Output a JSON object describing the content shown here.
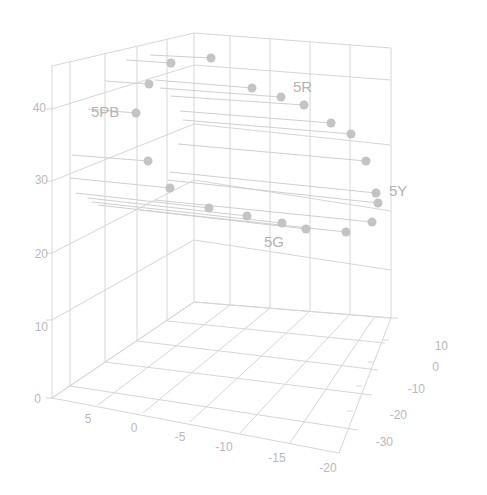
{
  "chart_data": {
    "type": "scatter3d",
    "title": "",
    "xlabel": "",
    "ylabel": "",
    "zlabel": "",
    "grid": true,
    "axes": {
      "z": {
        "ticks": [
          0,
          10,
          20,
          30,
          40
        ],
        "tick_labels": [
          "0",
          "10",
          "20",
          "30",
          "40"
        ]
      },
      "x": {
        "ticks": [
          5,
          0,
          -5,
          -10,
          -15,
          -20
        ],
        "tick_labels": [
          "5",
          "0",
          "-5",
          "-10",
          "-15",
          "-20"
        ]
      },
      "y": {
        "ticks": [
          10,
          0,
          -10,
          -20,
          -30
        ],
        "tick_labels": [
          "10",
          "0",
          "-10",
          "-20",
          "-30"
        ]
      }
    },
    "annotations": [
      {
        "text": "5PB",
        "px": [
          112,
          112
        ]
      },
      {
        "text": "5R",
        "px": [
          304,
          88
        ]
      },
      {
        "text": "5Y",
        "px": [
          398,
          190
        ]
      },
      {
        "text": "5G",
        "px": [
          275,
          242
        ]
      }
    ],
    "points": [
      {
        "px": [
          211,
          58
        ],
        "line_from": [
          150,
          55
        ]
      },
      {
        "px": [
          171,
          63
        ],
        "line_from": [
          126,
          60
        ]
      },
      {
        "px": [
          149,
          84
        ],
        "line_from": [
          105,
          81
        ]
      },
      {
        "px": [
          252,
          88
        ],
        "line_from": [
          155,
          80
        ]
      },
      {
        "px": [
          281,
          97
        ],
        "line_from": [
          160,
          88
        ]
      },
      {
        "px": [
          304,
          105
        ],
        "line_from": [
          170,
          96
        ]
      },
      {
        "px": [
          136,
          113
        ],
        "line_from": [
          88,
          109
        ]
      },
      {
        "px": [
          331,
          123
        ],
        "line_from": [
          180,
          111
        ]
      },
      {
        "px": [
          351,
          134
        ],
        "line_from": [
          183,
          120
        ]
      },
      {
        "px": [
          148,
          161
        ],
        "line_from": [
          72,
          155
        ]
      },
      {
        "px": [
          366,
          161
        ],
        "line_from": [
          178,
          144
        ]
      },
      {
        "px": [
          376,
          193
        ],
        "line_from": [
          170,
          172
        ]
      },
      {
        "px": [
          378,
          203
        ],
        "line_from": [
          168,
          180
        ]
      },
      {
        "px": [
          170,
          188
        ],
        "line_from": [
          70,
          178
        ]
      },
      {
        "px": [
          209,
          208
        ],
        "line_from": [
          76,
          193
        ]
      },
      {
        "px": [
          247,
          216
        ],
        "line_from": [
          88,
          198
        ]
      },
      {
        "px": [
          372,
          222
        ],
        "line_from": [
          155,
          200
        ]
      },
      {
        "px": [
          282,
          223
        ],
        "line_from": [
          92,
          202
        ]
      },
      {
        "px": [
          306,
          229
        ],
        "line_from": [
          98,
          205
        ]
      },
      {
        "px": [
          346,
          232
        ],
        "line_from": [
          140,
          210
        ]
      }
    ],
    "colors": {
      "point": "#c4c4c4",
      "grid": "#d6d6d6",
      "label": "#b9b9b9"
    }
  }
}
